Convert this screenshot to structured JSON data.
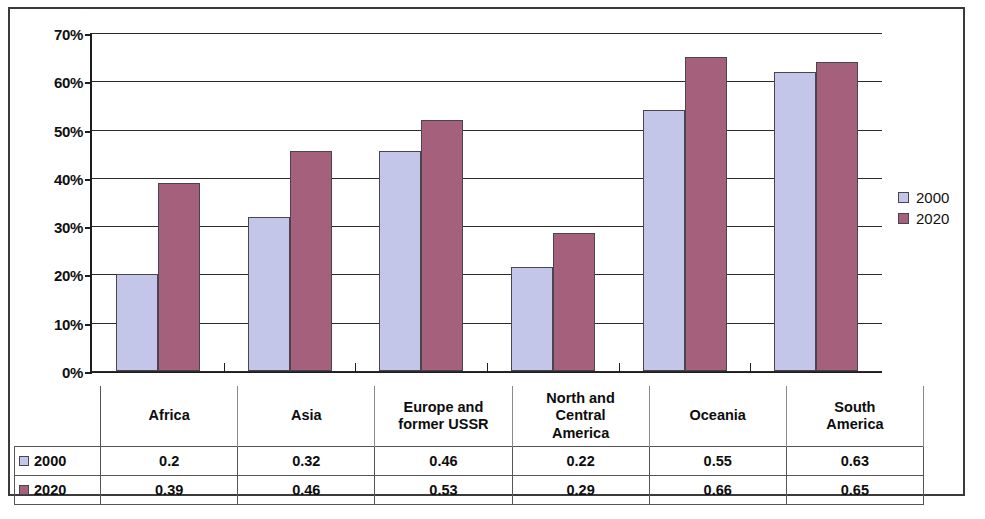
{
  "chart_data": {
    "type": "bar",
    "title": "",
    "subtitle": "",
    "xlabel": "",
    "ylabel": "",
    "categories": [
      "Africa",
      "Asia",
      "Europe and former USSR",
      "North and Central America",
      "Oceania",
      "South America"
    ],
    "series": [
      {
        "name": "2000",
        "color": "#c3c6e8",
        "values": [
          0.2,
          0.32,
          0.46,
          0.22,
          0.55,
          0.63
        ]
      },
      {
        "name": "2020",
        "color": "#a5617c",
        "values": [
          0.39,
          0.46,
          0.53,
          0.29,
          0.66,
          0.65
        ]
      }
    ],
    "ylim": [
      0,
      0.7
    ],
    "ytick_values": [
      0.7,
      0.6,
      0.5,
      0.4,
      0.3,
      0.2,
      0.1,
      0.0
    ],
    "ytick_labels": [
      "70%",
      "60%",
      "50%",
      "40%",
      "30%",
      "20%",
      "10%",
      "0%"
    ],
    "grid": true,
    "legend_position": "right",
    "bar_plot_values": {
      "2000": [
        0.2,
        0.32,
        0.455,
        0.215,
        0.54,
        0.62
      ],
      "2020": [
        0.39,
        0.455,
        0.52,
        0.285,
        0.65,
        0.64
      ]
    }
  },
  "legend": {
    "entries": [
      {
        "label": "2000",
        "color": "#c3c6e8"
      },
      {
        "label": "2020",
        "color": "#a5617c"
      }
    ]
  },
  "table": {
    "corner_label": "",
    "column_headers": [
      "Africa",
      "Asia",
      "Europe and\nformer USSR",
      "North and\nCentral\nAmerica",
      "Oceania",
      "South\nAmerica"
    ],
    "rows": [
      {
        "label": "2000",
        "color": "#c3c6e8",
        "cells": [
          "0.2",
          "0.32",
          "0.46",
          "0.22",
          "0.55",
          "0.63"
        ]
      },
      {
        "label": "2020",
        "color": "#a5617c",
        "cells": [
          "0.39",
          "0.46",
          "0.53",
          "0.29",
          "0.66",
          "0.65"
        ]
      }
    ]
  }
}
